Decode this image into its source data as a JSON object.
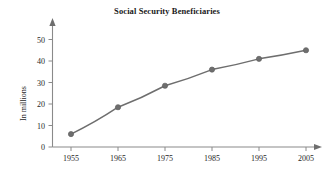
{
  "figure": {
    "title": "Social Security Beneficiaries",
    "background_color": "#ffffff",
    "axis_color": "#8a8a8a",
    "text_color": "#1f1f1f"
  },
  "chart_data": {
    "type": "line",
    "title": "Social Security Beneficiaries",
    "subtitle": "",
    "xlabel": "",
    "ylabel": "In millions",
    "categories": [
      "1955",
      "1965",
      "1975",
      "1985",
      "1995",
      "2005"
    ],
    "x": [
      1955,
      1965,
      1975,
      1985,
      1995,
      2005
    ],
    "values": [
      6,
      18.5,
      28.5,
      36,
      41,
      45
    ],
    "series": [
      {
        "name": "Beneficiaries",
        "values": [
          6,
          18.5,
          28.5,
          36,
          41,
          45
        ],
        "color": "#6e6e6e",
        "marker": "circle",
        "marker_color": "#6e6e6e"
      }
    ],
    "xlim": [
      1950,
      2012
    ],
    "ylim": [
      0,
      55
    ],
    "xticks": [
      1955,
      1965,
      1975,
      1985,
      1995,
      2005
    ],
    "xtick_labels": [
      "1955",
      "1965",
      "1975",
      "1985",
      "1995",
      "2005"
    ],
    "yticks": [
      0,
      10,
      20,
      30,
      40,
      50
    ],
    "ytick_labels": [
      "0",
      "10",
      "20",
      "30",
      "40",
      "50"
    ],
    "grid": false,
    "legend": false,
    "legend_position": "none",
    "axis_style": "arrow-tipped L-axes",
    "annotations": []
  }
}
